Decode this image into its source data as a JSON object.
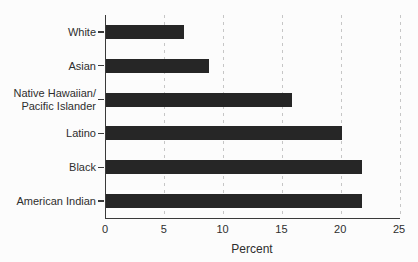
{
  "chart_data": {
    "type": "bar",
    "orientation": "horizontal",
    "title": "",
    "xlabel": "Percent",
    "ylabel": "",
    "categories": [
      "White",
      "Asian",
      "Native Hawaiian/\nPacific Islander",
      "Latino",
      "Black",
      "American Indian"
    ],
    "values": [
      6.6,
      8.8,
      15.8,
      20.1,
      21.8,
      21.8
    ],
    "xlim": [
      0,
      25
    ],
    "xticks": [
      0,
      5,
      10,
      15,
      20,
      25
    ],
    "grid": "vertical dashed gridlines at each x tick",
    "legend": "none",
    "colors": {
      "bar": "#262626",
      "axis": "#3a3a3a",
      "gridline": "#c6c6c6",
      "text": "#2e2e2e",
      "background": "#fcfcfc"
    }
  }
}
